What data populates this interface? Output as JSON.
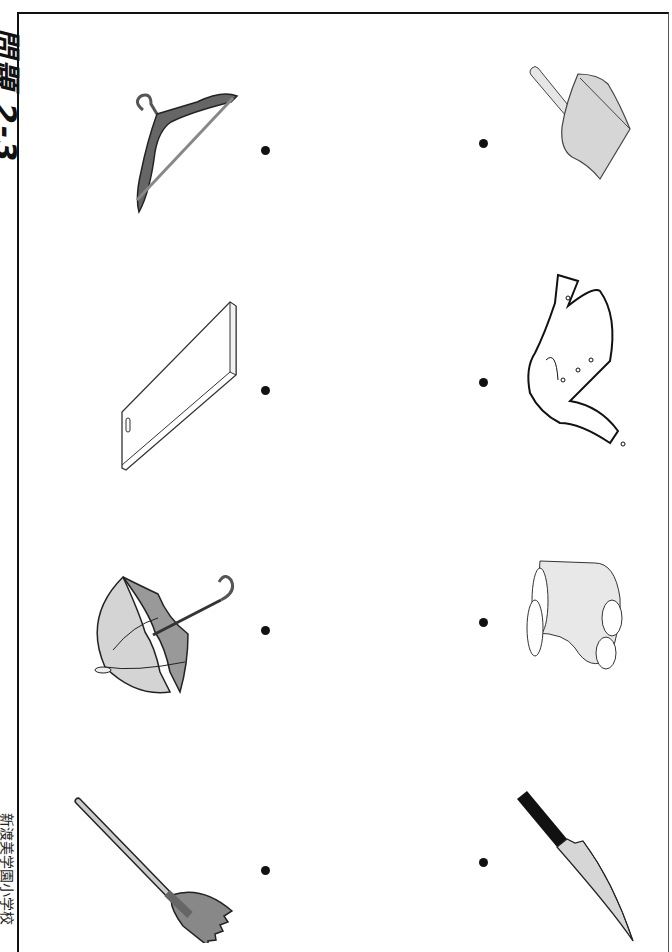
{
  "worksheet": {
    "title": "問題 2-3",
    "school": "新渡美学園小学校",
    "colors": {
      "border": "#111111",
      "dot": "#111111",
      "dark_gray": "#666666",
      "mid_gray": "#9a9a9a",
      "light_gray": "#d9d9d9"
    }
  },
  "left_column": {
    "items": [
      {
        "label": "hanger",
        "icon": "hanger-icon"
      },
      {
        "label": "cutting board",
        "icon": "cutting-board-icon"
      },
      {
        "label": "umbrella",
        "icon": "umbrella-icon"
      },
      {
        "label": "broom",
        "icon": "broom-icon"
      }
    ]
  },
  "right_column": {
    "items": [
      {
        "label": "dustpan",
        "icon": "dustpan-icon"
      },
      {
        "label": "jacket",
        "icon": "jacket-icon"
      },
      {
        "label": "rain boots",
        "icon": "boots-icon"
      },
      {
        "label": "kitchen knife",
        "icon": "knife-icon"
      }
    ]
  }
}
